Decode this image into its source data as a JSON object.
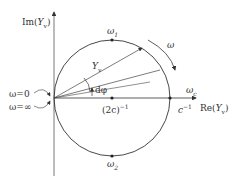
{
  "diagram": {
    "type": "admittance circle diagram",
    "axes": {
      "y_label": "Im(Y_v)",
      "x_label": "Re(Y_v)"
    },
    "points": {
      "omega1": "ω1",
      "omega2": "ω2",
      "omega_c": "ωc",
      "center": "(2c)^-1",
      "intercept": "c^-1"
    },
    "labels": {
      "omega_arrow": "ω",
      "phasor": "Yv",
      "dphi": "dφ",
      "omega_zero": "ω=0",
      "omega_inf": "ω=∞"
    },
    "text": {
      "im_prefix": "Im(",
      "im_var": "Y",
      "im_sub": "v",
      "close": ")",
      "re_prefix": "Re(",
      "re_var": "Y",
      "re_sub": "v",
      "omega": "ω",
      "sub1": "1",
      "sub2": "2",
      "subc": "c",
      "center_base": "(2c)",
      "neg1": "−1",
      "c_base": "c",
      "yv_var": "Y",
      "yv_sub": "v",
      "dphi": "dφ",
      "omega_zero": "ω=0",
      "omega_inf": "ω=∞"
    },
    "colors": {
      "line": "#333333",
      "background": "#ffffff"
    }
  }
}
